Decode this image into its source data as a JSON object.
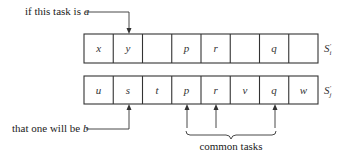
{
  "diagram": {
    "top_row": {
      "name": "S_i'",
      "label_base": "S",
      "label_sub": "i",
      "label_sup": "'",
      "cells": [
        "x",
        "y",
        "",
        "p",
        "r",
        "",
        "q",
        ""
      ]
    },
    "bottom_row": {
      "name": "S_j'",
      "label_base": "S",
      "label_sub": "j",
      "label_sup": "'",
      "cells": [
        "u",
        "s",
        "t",
        "p",
        "r",
        "v",
        "q",
        "w"
      ]
    },
    "annotations": {
      "top_pointer": {
        "text_prefix": "if this task is ",
        "text_var": "a",
        "points_to_cell": 1
      },
      "bottom_pointer": {
        "text_prefix": "that one will be ",
        "text_var": "b",
        "points_to_cell": 1
      },
      "common": {
        "label": "common tasks",
        "cells": [
          3,
          4,
          6
        ]
      }
    },
    "colors": {
      "stroke": "#333333",
      "text": "#222222",
      "background": "#ffffff"
    }
  }
}
